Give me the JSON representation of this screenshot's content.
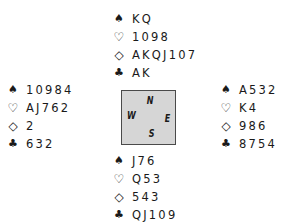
{
  "suits": {
    "spades": "♠",
    "hearts": "♡",
    "diamonds": "◇",
    "clubs": "♣"
  },
  "hands": {
    "north": {
      "spades": "KQ",
      "hearts": "1098",
      "diamonds": "AKQJ107",
      "clubs": "AK"
    },
    "west": {
      "spades": "10984",
      "hearts": "AJ762",
      "diamonds": "2",
      "clubs": "632"
    },
    "east": {
      "spades": "A532",
      "hearts": "K4",
      "diamonds": "986",
      "clubs": "8754"
    },
    "south": {
      "spades": "J76",
      "hearts": "Q53",
      "diamonds": "543",
      "clubs": "QJ109"
    }
  },
  "compass": {
    "north": "N",
    "west": "W",
    "east": "E",
    "south": "S",
    "background": "#d6d6d6",
    "border": "#4a4a4a"
  }
}
